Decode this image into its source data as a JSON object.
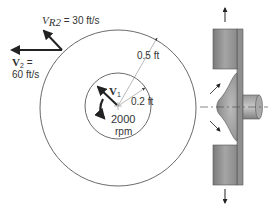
{
  "labels": {
    "vr2_symbol": "V",
    "vr2_sub": "R2",
    "vr2_value": " = 30 ft/s",
    "v2_symbol": "V",
    "v2_sub": "2",
    "v2_eq": " =",
    "v2_value": "60 ft/s",
    "v1_symbol": "V",
    "v1_sub": "1",
    "outer_radius": "0.5 ft",
    "inner_radius": "0.2 ft",
    "speed_value": "2000",
    "speed_unit": "rpm"
  },
  "colors": {
    "line": "#333333",
    "thin_line": "#777777",
    "impeller_fill": "#8a8a8a",
    "impeller_dark": "#6f6f6f"
  }
}
